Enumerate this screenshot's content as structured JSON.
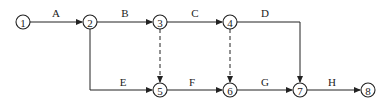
{
  "diagram": {
    "type": "activity-on-arrow network",
    "nodes": [
      {
        "id": "1",
        "label": "1",
        "x": 23,
        "y": 22
      },
      {
        "id": "2",
        "label": "2",
        "x": 90,
        "y": 22
      },
      {
        "id": "3",
        "label": "3",
        "x": 160,
        "y": 22
      },
      {
        "id": "4",
        "label": "4",
        "x": 230,
        "y": 22
      },
      {
        "id": "5",
        "label": "5",
        "x": 160,
        "y": 90
      },
      {
        "id": "6",
        "label": "6",
        "x": 230,
        "y": 90
      },
      {
        "id": "7",
        "label": "7",
        "x": 300,
        "y": 90
      },
      {
        "id": "8",
        "label": "8",
        "x": 368,
        "y": 90
      }
    ],
    "activities": [
      {
        "label": "A",
        "from": "1",
        "to": "2"
      },
      {
        "label": "B",
        "from": "2",
        "to": "3"
      },
      {
        "label": "C",
        "from": "3",
        "to": "4"
      },
      {
        "label": "D",
        "from": "4",
        "to": "7"
      },
      {
        "label": "E",
        "from": "2",
        "to": "5"
      },
      {
        "label": "F",
        "from": "5",
        "to": "6"
      },
      {
        "label": "G",
        "from": "6",
        "to": "7"
      },
      {
        "label": "H",
        "from": "7",
        "to": "8"
      }
    ],
    "dummy_activities": [
      {
        "from": "3",
        "to": "5"
      },
      {
        "from": "4",
        "to": "6"
      }
    ]
  }
}
